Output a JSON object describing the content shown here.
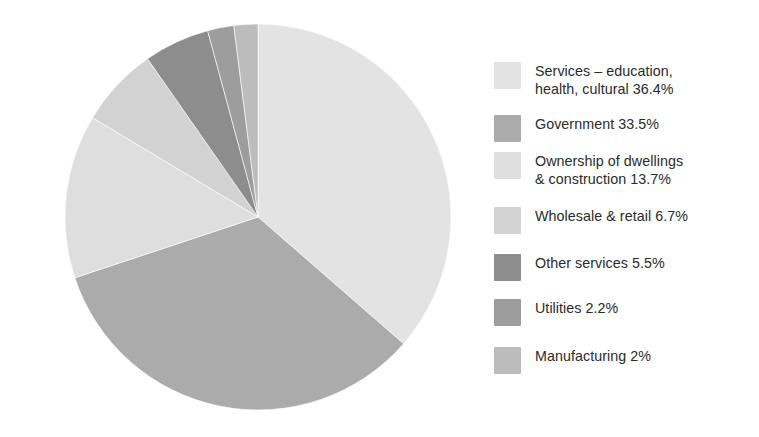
{
  "chart_data": {
    "type": "pie",
    "title": "",
    "subtitle": "",
    "xlabel": "",
    "ylabel": "",
    "legend_position": "right",
    "grid": false,
    "start_angle_deg": 0,
    "direction": "clockwise",
    "categories": [
      "Services – education, health, cultural",
      "Government",
      "Ownership of dwellings & construction",
      "Wholesale & retail",
      "Other services",
      "Utilities",
      "Manufacturing"
    ],
    "values": [
      36.4,
      33.5,
      13.7,
      6.7,
      5.5,
      2.2,
      2.0
    ],
    "value_unit": "%",
    "colors": [
      "#e3e3e3",
      "#ababab",
      "#dedede",
      "#d2d2d2",
      "#8d8d8d",
      "#9d9d9d",
      "#bcbcbc"
    ],
    "slices": [
      {
        "label": "Services – education, health, cultural",
        "value": 36.4,
        "color": "#e3e3e3"
      },
      {
        "label": "Government",
        "value": 33.5,
        "color": "#ababab"
      },
      {
        "label": "Ownership of dwellings & construction",
        "value": 13.7,
        "color": "#dedede"
      },
      {
        "label": "Wholesale & retail",
        "value": 6.7,
        "color": "#d2d2d2"
      },
      {
        "label": "Other services",
        "value": 5.5,
        "color": "#8d8d8d"
      },
      {
        "label": "Utilities",
        "value": 2.2,
        "color": "#9d9d9d"
      },
      {
        "label": "Manufacturing",
        "value": 2.0,
        "color": "#bcbcbc"
      }
    ]
  },
  "legend": {
    "items": [
      {
        "swatch_color": "#e3e3e3",
        "text": "Services – education,\nhealth, cultural 36.4%",
        "name": "legend-item-services"
      },
      {
        "swatch_color": "#ababab",
        "text": "Government 33.5%",
        "name": "legend-item-government"
      },
      {
        "swatch_color": "#dedede",
        "text": "Ownership of dwellings\n& construction 13.7%",
        "name": "legend-item-ownership-of-dwellings"
      },
      {
        "swatch_color": "#d2d2d2",
        "text": "Wholesale & retail 6.7%",
        "name": "legend-item-wholesale-retail"
      },
      {
        "swatch_color": "#8d8d8d",
        "text": "Other services 5.5%",
        "name": "legend-item-other-services"
      },
      {
        "swatch_color": "#9d9d9d",
        "text": "Utilities 2.2%",
        "name": "legend-item-utilities"
      },
      {
        "swatch_color": "#bcbcbc",
        "text": "Manufacturing 2%",
        "name": "legend-item-manufacturing"
      }
    ],
    "row_tops": [
      0,
      53,
      90,
      145,
      192,
      237,
      285
    ]
  },
  "canvas": {
    "background": "#ffffff",
    "text_color": "#2b2b2b"
  }
}
